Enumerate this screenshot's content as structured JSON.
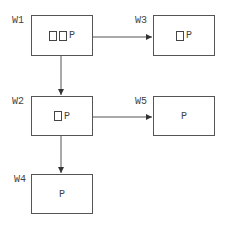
{
  "nodes": [
    {
      "id": "W1",
      "label": "W1",
      "squares": 2,
      "text": "P"
    },
    {
      "id": "W2",
      "label": "W2",
      "squares": 1,
      "text": "P"
    },
    {
      "id": "W3",
      "label": "W3",
      "squares": 1,
      "text": "P"
    },
    {
      "id": "W4",
      "label": "W4",
      "squares": 0,
      "text": "P"
    },
    {
      "id": "W5",
      "label": "W5",
      "squares": 0,
      "text": "P"
    }
  ],
  "edges": [
    {
      "from": "W1",
      "to": "W3"
    },
    {
      "from": "W1",
      "to": "W2"
    },
    {
      "from": "W2",
      "to": "W5"
    },
    {
      "from": "W2",
      "to": "W4"
    }
  ],
  "colors": {
    "line": "#555555",
    "text": "#444444"
  }
}
